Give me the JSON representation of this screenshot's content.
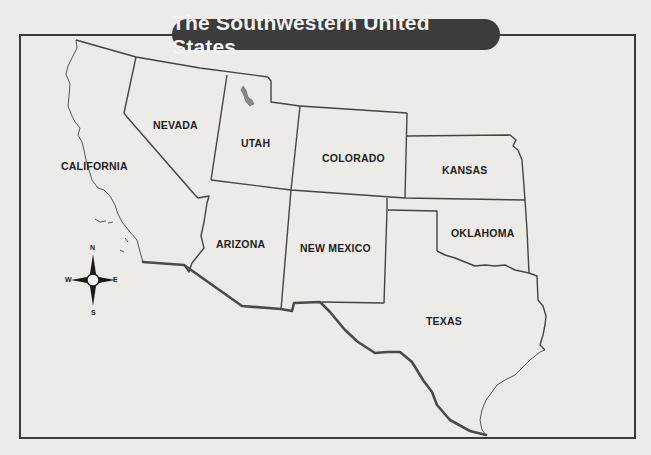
{
  "title": "The Southwestern United States",
  "states": [
    {
      "name": "CALIFORNIA",
      "x": 61,
      "y": 160
    },
    {
      "name": "NEVADA",
      "x": 153,
      "y": 119
    },
    {
      "name": "UTAH",
      "x": 241,
      "y": 137
    },
    {
      "name": "COLORADO",
      "x": 322,
      "y": 152
    },
    {
      "name": "KANSAS",
      "x": 442,
      "y": 164
    },
    {
      "name": "OKLAHOMA",
      "x": 451,
      "y": 227
    },
    {
      "name": "ARIZONA",
      "x": 216,
      "y": 238
    },
    {
      "name": "NEW MEXICO",
      "x": 300,
      "y": 242
    },
    {
      "name": "TEXAS",
      "x": 426,
      "y": 315
    }
  ],
  "compass": {
    "n": "N",
    "s": "S",
    "e": "E",
    "w": "W"
  },
  "colors": {
    "border": "#3a3a3a",
    "title_bg": "#3c3c3c",
    "background": "#ecebe8"
  }
}
